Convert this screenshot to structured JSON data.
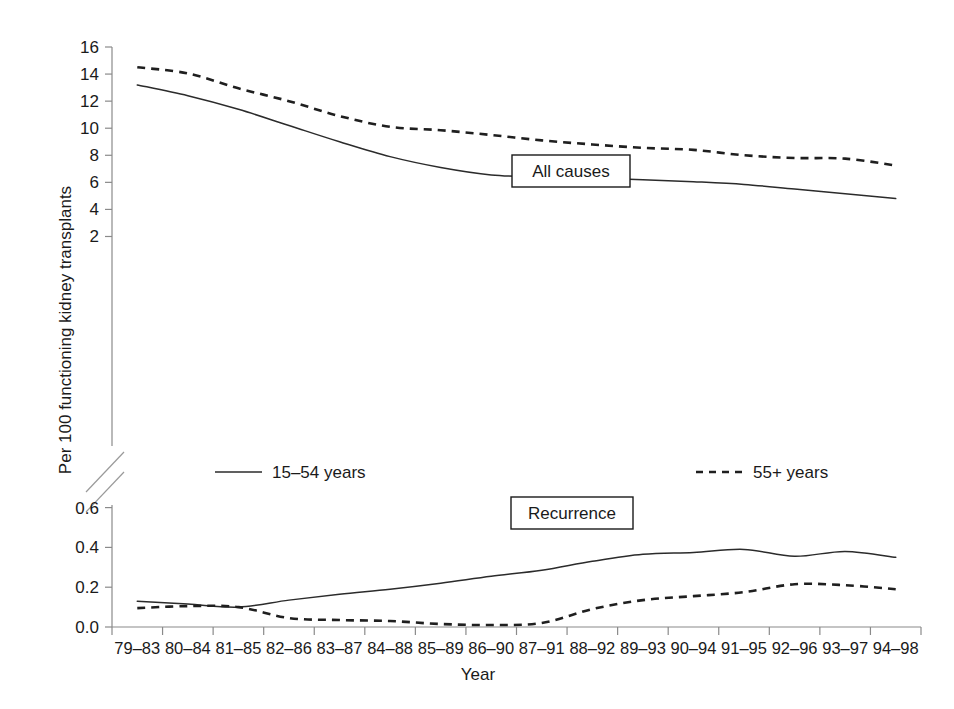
{
  "chart_data": {
    "type": "line",
    "title": "",
    "xlabel": "Year",
    "ylabel": "Per 100 functioning kidney transplants",
    "categories": [
      "79–83",
      "80–84",
      "81–85",
      "82–86",
      "83–87",
      "84–88",
      "85–89",
      "86–90",
      "87–91",
      "88–92",
      "89–93",
      "90–94",
      "91–95",
      "92–96",
      "93–97",
      "94–98"
    ],
    "grid": false,
    "legend_position": "middle-center",
    "axis_break": true,
    "panels": [
      {
        "name": "All causes",
        "annotation": "All causes",
        "ylim": [
          0,
          16
        ],
        "yticks": [
          2,
          4,
          6,
          8,
          10,
          12,
          14,
          16
        ],
        "ytick_labels": [
          "2",
          "4",
          "6",
          "8",
          "10",
          "12",
          "14",
          "16"
        ],
        "series": [
          {
            "name": "15–54 years",
            "style": "solid",
            "color": "#2b2b2b",
            "values": [
              13.2,
              12.4,
              11.4,
              10.2,
              9.0,
              7.9,
              7.1,
              6.55,
              6.4,
              6.3,
              6.2,
              6.05,
              5.85,
              5.5,
              5.15,
              4.8
            ]
          },
          {
            "name": "55+ years",
            "style": "dashed",
            "color": "#1f1f1f",
            "values": [
              14.5,
              14.05,
              12.95,
              12.0,
              10.9,
              10.1,
              9.85,
              9.5,
              9.1,
              8.8,
              8.55,
              8.4,
              8.0,
              7.8,
              7.75,
              7.25
            ]
          }
        ]
      },
      {
        "name": "Recurrence",
        "annotation": "Recurrence",
        "ylim": [
          0,
          0.7
        ],
        "yticks": [
          0.0,
          0.2,
          0.4,
          0.6
        ],
        "ytick_labels": [
          "0.0",
          "0.2",
          "0.4",
          "0.6"
        ],
        "series": [
          {
            "name": "15–54 years",
            "style": "solid",
            "color": "#2b2b2b",
            "values": [
              0.13,
              0.115,
              0.1,
              0.135,
              0.165,
              0.19,
              0.22,
              0.255,
              0.285,
              0.33,
              0.365,
              0.375,
              0.39,
              0.355,
              0.38,
              0.35
            ]
          },
          {
            "name": "55+ years",
            "style": "dashed",
            "color": "#1f1f1f",
            "values": [
              0.095,
              0.105,
              0.1,
              0.045,
              0.035,
              0.03,
              0.015,
              0.01,
              0.02,
              0.09,
              0.135,
              0.155,
              0.175,
              0.215,
              0.21,
              0.19
            ]
          }
        ]
      }
    ],
    "legend": [
      {
        "label": "15–54 years",
        "style": "solid"
      },
      {
        "label": "55+ years",
        "style": "dashed"
      }
    ]
  },
  "axes": {
    "x_title": "Year",
    "y_title": "Per 100 functioning kidney transplants"
  }
}
